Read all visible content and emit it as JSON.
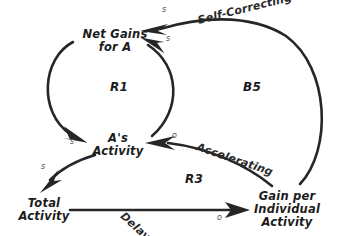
{
  "diagram": {
    "background_color": "#ffffff",
    "ink_color": "#262626",
    "nodes": [
      {
        "id": "net-gains-for-a",
        "lines": [
          "Net Gains",
          "for A"
        ],
        "x": 115,
        "y": 36
      },
      {
        "id": "as-activity",
        "lines": [
          "A's",
          "Activity"
        ],
        "x": 118,
        "y": 140
      },
      {
        "id": "total-activity",
        "lines": [
          "Total",
          "Activity"
        ],
        "x": 44,
        "y": 205
      },
      {
        "id": "gain-per-individual-activity",
        "lines": [
          "Gain per",
          "Individual",
          "Activity"
        ],
        "x": 287,
        "y": 205
      }
    ],
    "loop_labels": [
      {
        "id": "r1",
        "text": "R1",
        "x": 110,
        "y": 88
      },
      {
        "id": "b5",
        "text": "B5",
        "x": 243,
        "y": 88
      },
      {
        "id": "r3",
        "text": "R3",
        "x": 185,
        "y": 180
      }
    ],
    "link_labels": [
      {
        "id": "self-correcting",
        "text": "Self-Correcting",
        "x": 198,
        "y": 22,
        "rotation": -14
      },
      {
        "id": "accelerating",
        "text": "Accelerating",
        "x": 197,
        "y": 148,
        "rotation": 19
      },
      {
        "id": "delay",
        "text": "Delay",
        "x": 122,
        "y": 216,
        "rotation": 42
      }
    ],
    "polarities": [
      {
        "id": "self-correcting-polarity",
        "symbol": "s",
        "x": 162,
        "y": 9
      },
      {
        "id": "b5-inner-polarity",
        "symbol": "s",
        "x": 166,
        "y": 38
      },
      {
        "id": "r1-to-activity-polarity",
        "symbol": "s",
        "x": 70,
        "y": 141
      },
      {
        "id": "accelerating-polarity",
        "symbol": "o",
        "x": 172,
        "y": 135
      },
      {
        "id": "total-activity-polarity",
        "symbol": "s",
        "x": 41,
        "y": 166
      },
      {
        "id": "delay-polarity",
        "symbol": "o",
        "x": 217,
        "y": 217
      }
    ],
    "links": [
      {
        "id": "net-gains-to-as-activity",
        "from": "net-gains-for-a",
        "to": "as-activity",
        "polarity": "s",
        "loop": "R1"
      },
      {
        "id": "as-activity-to-net-gains",
        "from": "as-activity",
        "to": "net-gains-for-a",
        "polarity": "s",
        "loop": "R1"
      },
      {
        "id": "as-activity-to-total-activity",
        "from": "as-activity",
        "to": "total-activity",
        "polarity": "s",
        "loop": "R3"
      },
      {
        "id": "total-activity-to-gain-per-individual",
        "from": "total-activity",
        "to": "gain-per-individual-activity",
        "polarity": "o",
        "label": "Delay",
        "loop": "R3"
      },
      {
        "id": "gain-per-individual-to-as-activity",
        "from": "gain-per-individual-activity",
        "to": "as-activity",
        "polarity": "o",
        "label": "Accelerating",
        "loop": "R3"
      },
      {
        "id": "gain-per-individual-to-net-gains",
        "from": "gain-per-individual-activity",
        "to": "net-gains-for-a",
        "polarity": "s",
        "label": "Self-Correcting",
        "loop": "B5"
      }
    ]
  }
}
